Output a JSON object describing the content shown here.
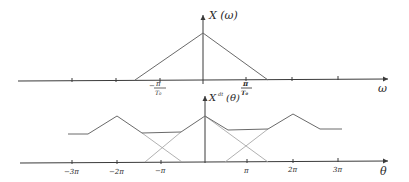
{
  "top_plot": {
    "y_label": "X (ω)",
    "x_label": "ω",
    "tick_labels": {
      "neg": {
        "num": "π",
        "den": "T₀",
        "sign": "−"
      },
      "pos": {
        "num": "π",
        "den": "T₀"
      }
    },
    "shape": "triangle",
    "geometry": {
      "axis_y": 80,
      "axis_x0": 18,
      "axis_x1": 388,
      "origin_x": 203,
      "peak": [
        203,
        33
      ],
      "left_base": [
        135,
        80
      ],
      "right_base": [
        268,
        80
      ],
      "ticks_x": [
        72,
        116,
        160,
        246,
        292,
        338
      ]
    }
  },
  "bottom_plot": {
    "y_label_main": "X",
    "y_label_sup": "dt",
    "y_label_arg": "(θ)",
    "x_label": "θ",
    "tick_labels": [
      "−3π",
      "−2π",
      "−π",
      "π",
      "2π",
      "3π"
    ],
    "geometry": {
      "axis_y": 162,
      "axis_x0": 20,
      "axis_x1": 388,
      "origin_x": 205,
      "ticks_x": [
        72,
        117,
        161,
        247,
        293,
        338
      ],
      "sum_polyline": [
        [
          68,
          134
        ],
        [
          88,
          134
        ],
        [
          117,
          116
        ],
        [
          142,
          133
        ],
        [
          181,
          132
        ],
        [
          205,
          116
        ],
        [
          228,
          130
        ],
        [
          268,
          129
        ],
        [
          293,
          114
        ],
        [
          320,
          129
        ],
        [
          342,
          129
        ]
      ],
      "ghost_lines": [
        [
          [
            142,
            133
          ],
          [
            182,
            162
          ]
        ],
        [
          [
            145,
            162
          ],
          [
            181,
            132
          ]
        ],
        [
          [
            205,
            116
          ],
          [
            268,
            162
          ]
        ],
        [
          [
            225,
            162
          ],
          [
            268,
            129
          ]
        ]
      ]
    }
  }
}
